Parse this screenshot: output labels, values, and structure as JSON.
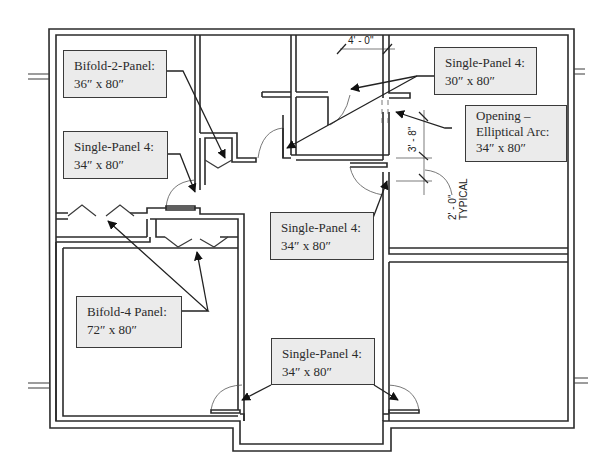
{
  "diagram": {
    "type": "architectural floor plan",
    "colors": {
      "wall": "#2b2b2b",
      "callout_fill": "#ebebeb",
      "callout_border": "#3a3a3a",
      "text": "#2a2a2a"
    }
  },
  "callouts": [
    {
      "id": "bifold-2",
      "line1": "Bifold-2-Panel:",
      "line2": "36″ x 80″"
    },
    {
      "id": "single-left",
      "line1": "Single-Panel 4:",
      "line2": "34″ x 80″"
    },
    {
      "id": "single-top-right",
      "line1": "Single-Panel 4:",
      "line2": "30″ x 80″"
    },
    {
      "id": "opening",
      "line1": "Opening –",
      "line2": "Elliptical Arc:",
      "line3": "34″ x 80″"
    },
    {
      "id": "single-center",
      "line1": "Single-Panel 4:",
      "line2": "34″ x 80″"
    },
    {
      "id": "bifold-4",
      "line1": "Bifold-4 Panel:",
      "line2": "72″ x 80″"
    },
    {
      "id": "single-bottom",
      "line1": "Single-Panel 4:",
      "line2": "34″ x 80″"
    }
  ],
  "dimensions": {
    "width_4ft": "4' - 0\"",
    "height_3ft8": "3' - 8\"",
    "typical_2ft": "2' - 0\"",
    "typical_label": "TYPICAL"
  }
}
